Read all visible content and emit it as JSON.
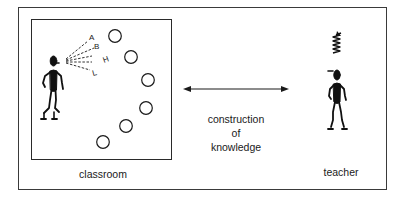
{
  "diagram": {
    "classroom": {
      "label": "classroom",
      "speaker": "student-speaking-figure",
      "speech_letters": [
        "A",
        "B",
        "H",
        "L"
      ],
      "listener_count": 6
    },
    "link": {
      "type": "bidirectional-arrow",
      "caption_lines": [
        "construction",
        "of",
        "knowledge"
      ]
    },
    "teacher": {
      "label": "teacher",
      "figure": "teacher-figure",
      "thought_symbol": "spring-coil"
    },
    "colors": {
      "ink": "#1a1a1a",
      "background": "#ffffff"
    }
  }
}
